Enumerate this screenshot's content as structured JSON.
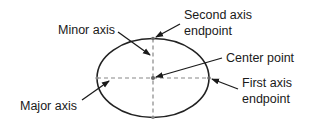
{
  "diagram": {
    "labels": {
      "minor_axis": "Minor axis",
      "major_axis": "Major axis",
      "second_axis_line1": "Second axis",
      "second_axis_line2": "endpoint",
      "center_point": "Center point",
      "first_axis_line1": "First axis",
      "first_axis_line2": "endpoint"
    },
    "colors": {
      "stroke": "#222222",
      "dashed": "#888888",
      "point": "#666666"
    }
  }
}
